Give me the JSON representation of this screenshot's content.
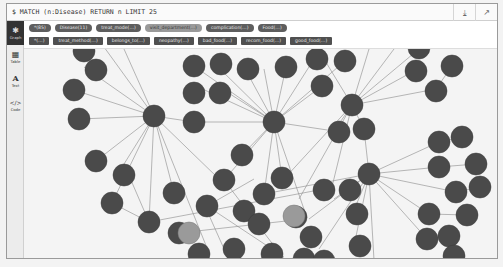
{
  "query": {
    "text": "$ MATCH (n:Disease) RETURN n LIMIT 25",
    "download_icon": "download-icon",
    "pin_icon": "pin-icon"
  },
  "sidebar": {
    "items": [
      {
        "label": "Graph",
        "icon": "graph-icon",
        "glyph": "✱",
        "active": true
      },
      {
        "label": "Table",
        "icon": "table-icon",
        "glyph": "▦",
        "active": false
      },
      {
        "label": "Text",
        "icon": "text-icon",
        "glyph": "A",
        "active": false
      },
      {
        "label": "Code",
        "icon": "code-icon",
        "glyph": "</>",
        "active": false
      }
    ]
  },
  "legend": {
    "node_labels": [
      {
        "label": "*(85)"
      },
      {
        "label": "Disease(11)"
      },
      {
        "label": "treat_mode(…)"
      },
      {
        "label": "visit_department(…)"
      },
      {
        "label": "complication(…)"
      },
      {
        "label": "Food(…)"
      }
    ],
    "relationship_types": [
      {
        "label": "*(…)"
      },
      {
        "label": "treat_method(…)"
      },
      {
        "label": "belongs_to(…)"
      },
      {
        "label": "neopathy(…)"
      },
      {
        "label": "bad_food(…)"
      },
      {
        "label": "recom_food(…)"
      },
      {
        "label": "good_food(…)"
      }
    ]
  },
  "graph": {
    "node_color": "#4a4a4a",
    "highlight_color": "#9a9a9a",
    "edge_color": "#8a8a8a",
    "background": "#f4f4f4"
  }
}
